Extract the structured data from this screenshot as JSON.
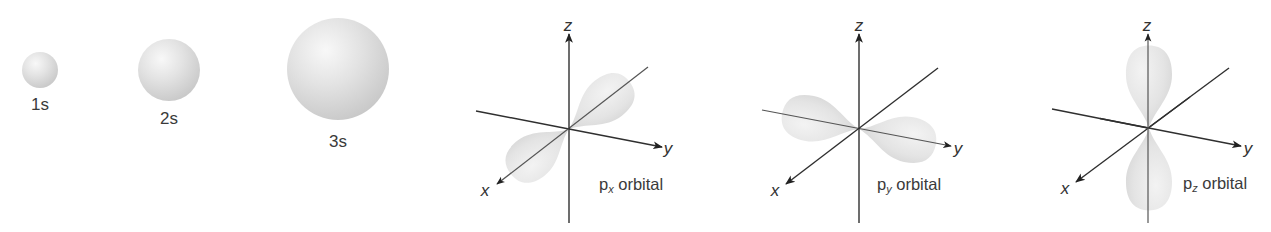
{
  "figure": {
    "s_orbitals": [
      {
        "label": "1s",
        "cx": 40,
        "cy": 70,
        "r": 18,
        "label_y": 110
      },
      {
        "label": "2s",
        "cx": 169,
        "cy": 70,
        "r": 31,
        "label_y": 124
      },
      {
        "label": "3s",
        "cx": 338,
        "cy": 69,
        "r": 51,
        "label_y": 147
      }
    ],
    "p_orbitals": [
      {
        "name": "px",
        "label_main": "p",
        "label_sub": "x",
        "label_rest": " orbital",
        "orientation_axis": "x",
        "axes": {
          "z": "z",
          "y": "y",
          "x": "x"
        }
      },
      {
        "name": "py",
        "label_main": "p",
        "label_sub": "y",
        "label_rest": " orbital",
        "orientation_axis": "y",
        "axes": {
          "z": "z",
          "y": "y",
          "x": "x"
        }
      },
      {
        "name": "pz",
        "label_main": "p",
        "label_sub": "z",
        "label_rest": " orbital",
        "orientation_axis": "z",
        "axes": {
          "z": "z",
          "y": "y",
          "x": "x"
        }
      }
    ],
    "colors": {
      "sphere_highlight": "#f7f7f7",
      "sphere_shadow": "#c9c9c9",
      "lobe_fill": "#e6e6e6",
      "axis": "#2f2f2f",
      "text": "#3a3a3a"
    }
  }
}
